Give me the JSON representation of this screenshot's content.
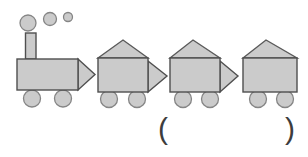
{
  "figure": {
    "canvas": {
      "width": 308,
      "height": 157,
      "background": "#ffffff"
    },
    "palette": {
      "shape_fill": "#cbcbcb",
      "body_stroke": "#4f4f4f",
      "soft_stroke": "#858585"
    },
    "shapes": [
      {
        "kind": "circle",
        "name": "smoke-puff-large",
        "cx": 28,
        "cy": 23,
        "r": 8,
        "stroke": "#858585",
        "sw": 1.3
      },
      {
        "kind": "circle",
        "name": "smoke-puff-medium",
        "cx": 50,
        "cy": 19,
        "r": 6.5,
        "stroke": "#858585",
        "sw": 1.3
      },
      {
        "kind": "circle",
        "name": "smoke-puff-small",
        "cx": 68,
        "cy": 17,
        "r": 4.5,
        "stroke": "#858585",
        "sw": 1.3
      },
      {
        "kind": "rect",
        "name": "locomotive-chimney",
        "x": 25.5,
        "y": 33,
        "w": 10.5,
        "h": 26,
        "stroke": "#4f4f4f",
        "sw": 1.4
      },
      {
        "kind": "circle",
        "name": "locomotive-wheel-front",
        "cx": 32,
        "cy": 98.5,
        "r": 8.5,
        "stroke": "#858585",
        "sw": 1.3
      },
      {
        "kind": "circle",
        "name": "locomotive-wheel-rear",
        "cx": 63,
        "cy": 98.5,
        "r": 8.5,
        "stroke": "#858585",
        "sw": 1.3
      },
      {
        "kind": "polygon",
        "name": "locomotive-nose-triangle",
        "points": "78,59 95,74.5 78,90",
        "stroke": "#4f4f4f",
        "sw": 1.4
      },
      {
        "kind": "rect",
        "name": "locomotive-body",
        "x": 17,
        "y": 59,
        "w": 61,
        "h": 31,
        "stroke": "#4f4f4f",
        "sw": 1.4
      },
      {
        "kind": "circle",
        "name": "car1-wheel-front",
        "cx": 109,
        "cy": 99,
        "r": 8.5,
        "stroke": "#858585",
        "sw": 1.3
      },
      {
        "kind": "circle",
        "name": "car1-wheel-rear",
        "cx": 137,
        "cy": 99,
        "r": 8.5,
        "stroke": "#858585",
        "sw": 1.3
      },
      {
        "kind": "polygon",
        "name": "car1-roof-triangle",
        "points": "98,58 123,40 148,58",
        "stroke": "#5a5a5a",
        "sw": 1.4
      },
      {
        "kind": "polygon",
        "name": "car1-coupler-triangle",
        "points": "148,61 167,76 148,92",
        "stroke": "#4f4f4f",
        "sw": 1.4
      },
      {
        "kind": "rect",
        "name": "car1-body",
        "x": 98,
        "y": 58,
        "w": 50,
        "h": 34,
        "stroke": "#4f4f4f",
        "sw": 1.4
      },
      {
        "kind": "circle",
        "name": "car2-wheel-front",
        "cx": 183,
        "cy": 99,
        "r": 8.5,
        "stroke": "#858585",
        "sw": 1.3
      },
      {
        "kind": "circle",
        "name": "car2-wheel-rear",
        "cx": 210,
        "cy": 99,
        "r": 8.5,
        "stroke": "#858585",
        "sw": 1.3
      },
      {
        "kind": "polygon",
        "name": "car2-roof-triangle",
        "points": "170,58 193,40 220,58",
        "stroke": "#5a5a5a",
        "sw": 1.4
      },
      {
        "kind": "polygon",
        "name": "car2-coupler-triangle",
        "points": "220,61 238,76 220,92",
        "stroke": "#4f4f4f",
        "sw": 1.4
      },
      {
        "kind": "rect",
        "name": "car2-body",
        "x": 170,
        "y": 58,
        "w": 50,
        "h": 34,
        "stroke": "#4f4f4f",
        "sw": 1.4
      },
      {
        "kind": "circle",
        "name": "car3-wheel-front",
        "cx": 258,
        "cy": 99,
        "r": 8.5,
        "stroke": "#858585",
        "sw": 1.3
      },
      {
        "kind": "circle",
        "name": "car3-wheel-rear",
        "cx": 285,
        "cy": 99,
        "r": 8.5,
        "stroke": "#858585",
        "sw": 1.3
      },
      {
        "kind": "polygon",
        "name": "car3-roof-triangle",
        "points": "243,58 266,40 297,58",
        "stroke": "#5a5a5a",
        "sw": 1.4
      },
      {
        "kind": "rect",
        "name": "car3-body",
        "x": 243,
        "y": 58,
        "w": 54,
        "h": 34,
        "stroke": "#4f4f4f",
        "sw": 1.4
      }
    ]
  },
  "answer_blank": {
    "open": "(",
    "close": ")"
  }
}
